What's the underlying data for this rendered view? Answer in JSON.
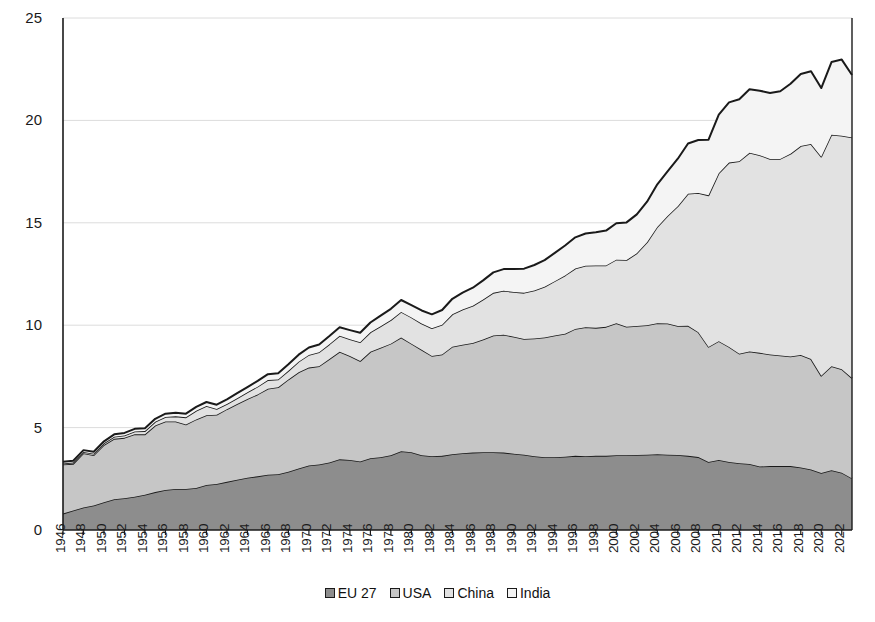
{
  "chart_data": {
    "type": "area",
    "stacked": true,
    "title": "",
    "subtitle": "",
    "xlabel": "",
    "ylabel": "",
    "xlim": [
      1946,
      2023
    ],
    "ylim": [
      0,
      25
    ],
    "yticks": [
      0,
      5,
      10,
      15,
      20,
      25
    ],
    "grid": true,
    "grid_axis": "y",
    "legend_position": "bottom",
    "x": [
      1946,
      1947,
      1948,
      1949,
      1950,
      1951,
      1952,
      1953,
      1954,
      1955,
      1956,
      1957,
      1958,
      1959,
      1960,
      1961,
      1962,
      1963,
      1964,
      1965,
      1966,
      1967,
      1968,
      1969,
      1970,
      1971,
      1972,
      1973,
      1974,
      1975,
      1976,
      1977,
      1978,
      1979,
      1980,
      1981,
      1982,
      1983,
      1984,
      1985,
      1986,
      1987,
      1988,
      1989,
      1990,
      1991,
      1992,
      1993,
      1994,
      1995,
      1996,
      1997,
      1998,
      1999,
      2000,
      2001,
      2002,
      2003,
      2004,
      2005,
      2006,
      2007,
      2008,
      2009,
      2010,
      2011,
      2012,
      2013,
      2014,
      2015,
      2016,
      2017,
      2018,
      2019,
      2020,
      2021,
      2022,
      2023
    ],
    "xticks": [
      1946,
      1948,
      1950,
      1952,
      1954,
      1956,
      1958,
      1960,
      1962,
      1964,
      1966,
      1968,
      1970,
      1972,
      1974,
      1976,
      1978,
      1980,
      1982,
      1984,
      1986,
      1988,
      1990,
      1992,
      1994,
      1996,
      1998,
      2000,
      2002,
      2004,
      2006,
      2008,
      2010,
      2012,
      2014,
      2016,
      2018,
      2020,
      2022
    ],
    "series": [
      {
        "name": "EU 27",
        "color": "#8d8d8d",
        "values": [
          0.8,
          0.95,
          1.1,
          1.2,
          1.35,
          1.5,
          1.55,
          1.62,
          1.72,
          1.85,
          1.95,
          2.0,
          2.0,
          2.05,
          2.2,
          2.25,
          2.35,
          2.45,
          2.55,
          2.62,
          2.7,
          2.72,
          2.85,
          3.0,
          3.15,
          3.2,
          3.3,
          3.45,
          3.42,
          3.35,
          3.5,
          3.55,
          3.65,
          3.85,
          3.8,
          3.65,
          3.6,
          3.62,
          3.7,
          3.75,
          3.78,
          3.8,
          3.8,
          3.78,
          3.72,
          3.68,
          3.6,
          3.55,
          3.55,
          3.58,
          3.62,
          3.6,
          3.62,
          3.62,
          3.65,
          3.65,
          3.66,
          3.68,
          3.7,
          3.68,
          3.66,
          3.62,
          3.56,
          3.32,
          3.42,
          3.32,
          3.26,
          3.22,
          3.1,
          3.12,
          3.12,
          3.12,
          3.05,
          2.95,
          2.78,
          2.92,
          2.8,
          2.52
        ]
      },
      {
        "name": "USA",
        "color": "#c6c6c6",
        "values": [
          2.4,
          2.28,
          2.65,
          2.45,
          2.8,
          2.95,
          2.95,
          3.05,
          2.95,
          3.25,
          3.35,
          3.3,
          3.15,
          3.35,
          3.4,
          3.38,
          3.55,
          3.7,
          3.85,
          4.0,
          4.2,
          4.25,
          4.5,
          4.7,
          4.78,
          4.8,
          5.05,
          5.25,
          5.08,
          4.9,
          5.2,
          5.35,
          5.45,
          5.55,
          5.3,
          5.15,
          4.9,
          4.95,
          5.25,
          5.3,
          5.35,
          5.5,
          5.7,
          5.75,
          5.72,
          5.65,
          5.75,
          5.85,
          5.95,
          6.0,
          6.2,
          6.3,
          6.25,
          6.3,
          6.45,
          6.28,
          6.3,
          6.32,
          6.4,
          6.4,
          6.3,
          6.35,
          6.1,
          5.62,
          5.8,
          5.62,
          5.35,
          5.5,
          5.55,
          5.45,
          5.4,
          5.35,
          5.5,
          5.4,
          4.75,
          5.08,
          5.05,
          4.9
        ]
      },
      {
        "name": "China",
        "color": "#e2e2e2",
        "values": [
          0.05,
          0.06,
          0.06,
          0.07,
          0.08,
          0.1,
          0.12,
          0.14,
          0.16,
          0.18,
          0.22,
          0.25,
          0.35,
          0.42,
          0.45,
          0.28,
          0.25,
          0.28,
          0.32,
          0.38,
          0.42,
          0.38,
          0.42,
          0.52,
          0.62,
          0.68,
          0.72,
          0.78,
          0.82,
          0.92,
          0.95,
          1.05,
          1.15,
          1.25,
          1.28,
          1.28,
          1.35,
          1.45,
          1.58,
          1.72,
          1.82,
          1.95,
          2.08,
          2.15,
          2.18,
          2.25,
          2.35,
          2.48,
          2.65,
          2.85,
          2.95,
          3.0,
          3.05,
          3.0,
          3.1,
          3.25,
          3.55,
          4.05,
          4.7,
          5.25,
          5.85,
          6.45,
          6.8,
          7.4,
          8.2,
          9.0,
          9.4,
          9.7,
          9.65,
          9.55,
          9.6,
          9.9,
          10.2,
          10.5,
          10.7,
          11.3,
          11.4,
          11.75
        ]
      },
      {
        "name": "India",
        "color": "#f4f4f4",
        "values": [
          0.08,
          0.09,
          0.09,
          0.1,
          0.1,
          0.12,
          0.12,
          0.13,
          0.14,
          0.15,
          0.16,
          0.17,
          0.18,
          0.19,
          0.2,
          0.21,
          0.23,
          0.25,
          0.26,
          0.28,
          0.29,
          0.3,
          0.32,
          0.34,
          0.36,
          0.38,
          0.4,
          0.42,
          0.44,
          0.46,
          0.48,
          0.52,
          0.55,
          0.58,
          0.6,
          0.64,
          0.68,
          0.72,
          0.76,
          0.82,
          0.88,
          0.94,
          1.0,
          1.06,
          1.12,
          1.18,
          1.24,
          1.3,
          1.38,
          1.46,
          1.52,
          1.58,
          1.62,
          1.7,
          1.78,
          1.84,
          1.9,
          1.98,
          2.08,
          2.18,
          2.32,
          2.45,
          2.58,
          2.72,
          2.86,
          2.94,
          3.02,
          3.1,
          3.15,
          3.22,
          3.3,
          3.42,
          3.52,
          3.55,
          3.35,
          3.55,
          3.72,
          3.05
        ]
      }
    ]
  },
  "axes": {
    "y_tick_labels": [
      "25",
      "20",
      "15",
      "10",
      "5",
      "0"
    ],
    "x_tick_labels": [
      "1946",
      "1948",
      "1950",
      "1952",
      "1954",
      "1956",
      "1958",
      "1960",
      "1962",
      "1964",
      "1966",
      "1968",
      "1970",
      "1972",
      "1974",
      "1976",
      "1978",
      "1980",
      "1982",
      "1984",
      "1986",
      "1988",
      "1990",
      "1992",
      "1994",
      "1996",
      "1998",
      "2000",
      "2002",
      "2004",
      "2006",
      "2008",
      "2010",
      "2012",
      "2014",
      "2016",
      "2018",
      "2020",
      "2022"
    ]
  },
  "legend": {
    "items": [
      {
        "label": "EU 27",
        "color": "#8d8d8d"
      },
      {
        "label": "USA",
        "color": "#c6c6c6"
      },
      {
        "label": "China",
        "color": "#e2e2e2"
      },
      {
        "label": "India",
        "color": "#f4f4f4"
      }
    ]
  },
  "style": {
    "background": "#ffffff",
    "axis_color": "#1a1a1a",
    "grid_color": "#dcdcdc",
    "outline_color": "#1a1a1a"
  }
}
